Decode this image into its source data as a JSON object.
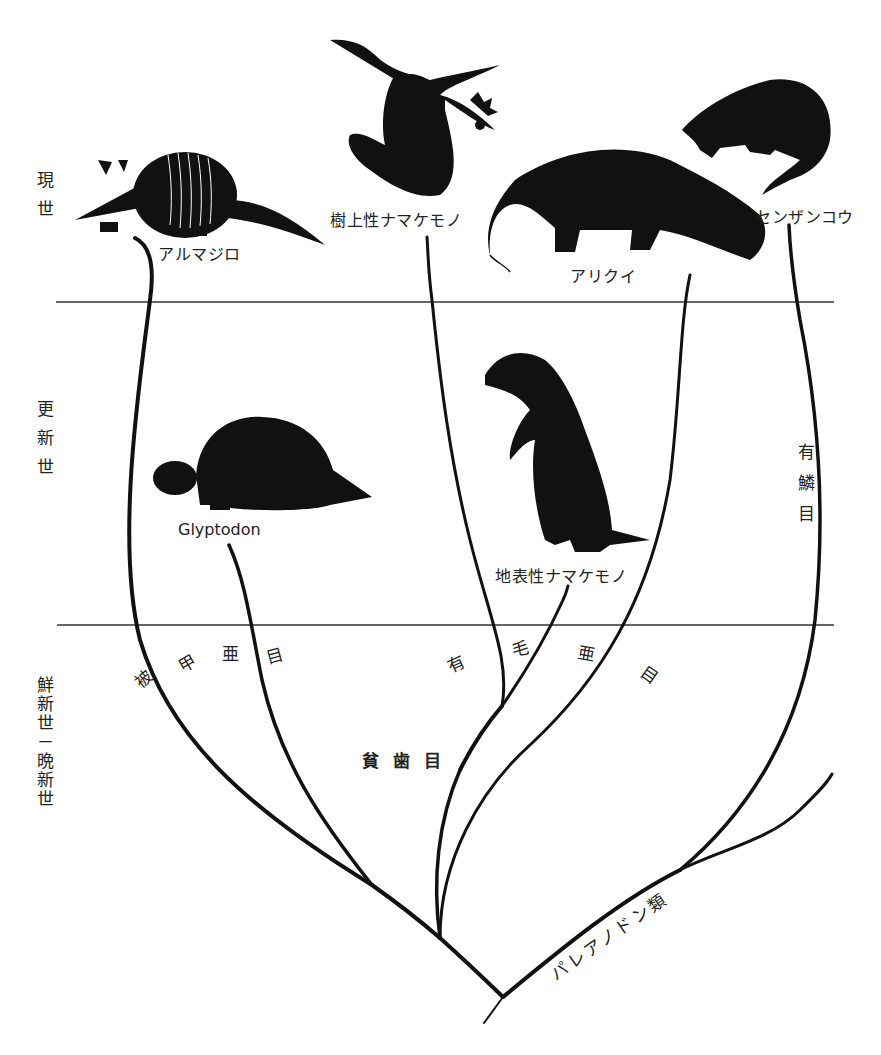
{
  "eras": {
    "recent": "現世",
    "pleistocene": "更新世",
    "pliocene_miocene": "鮮新世－晩新世"
  },
  "animals": {
    "armadillo": "アルマジロ",
    "tree_sloth": "樹上性ナマケモノ",
    "anteater": "アリクイ",
    "pangolin": "センザンコウ",
    "glyptodon": "Glyptodon",
    "ground_sloth": "地表性ナマケモノ"
  },
  "groups": {
    "cingulata": [
      "被",
      "甲",
      "亜",
      "目"
    ],
    "pilosa": [
      "有",
      "毛",
      "亜",
      "目"
    ],
    "xenarthra": "貧 歯 目",
    "pholidota": "有鱗目",
    "palaeanodonta": "パレアノドン類"
  },
  "boundaries": {
    "line1_y": 302,
    "line2_y": 625
  },
  "colors": {
    "ink": "#111111",
    "paper": "#ffffff",
    "rule": "#333333"
  }
}
